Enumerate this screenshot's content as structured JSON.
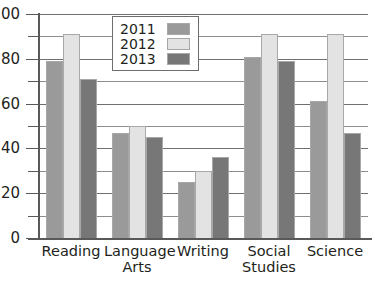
{
  "chart_data": {
    "type": "bar",
    "title": "",
    "xlabel": "",
    "ylabel": "",
    "ylim": [
      0,
      100
    ],
    "grid": true,
    "legend_position": "top-center-inside",
    "categories": [
      "Reading",
      "Language\nArts",
      "Writing",
      "Social\nStudies",
      "Science"
    ],
    "y_ticks": [
      0,
      20,
      40,
      60,
      80,
      100
    ],
    "y_tick_labels": [
      "0",
      "20",
      "40",
      "60",
      "80",
      "100"
    ],
    "minor_gridlines": [
      10,
      30,
      50,
      70,
      90
    ],
    "series": [
      {
        "name": "2011",
        "color": "#9a9a9a",
        "values": [
          79,
          47,
          25,
          81,
          61
        ]
      },
      {
        "name": "2012",
        "color": "#e3e3e3",
        "values": [
          91,
          50,
          30,
          91,
          91
        ]
      },
      {
        "name": "2013",
        "color": "#777777",
        "values": [
          71,
          45,
          36,
          79,
          47
        ]
      }
    ]
  },
  "axis": {
    "line_color": "#58595b",
    "gridline_color": "#8d8d8d"
  }
}
